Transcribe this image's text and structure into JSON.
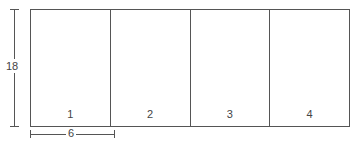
{
  "diagram": {
    "panels": [
      {
        "label": "1"
      },
      {
        "label": "2"
      },
      {
        "label": "3"
      },
      {
        "label": "4"
      }
    ],
    "dimensions": {
      "height_label": "18",
      "width_label": "6"
    },
    "colors": {
      "line": "#555555",
      "text": "#444444"
    }
  }
}
